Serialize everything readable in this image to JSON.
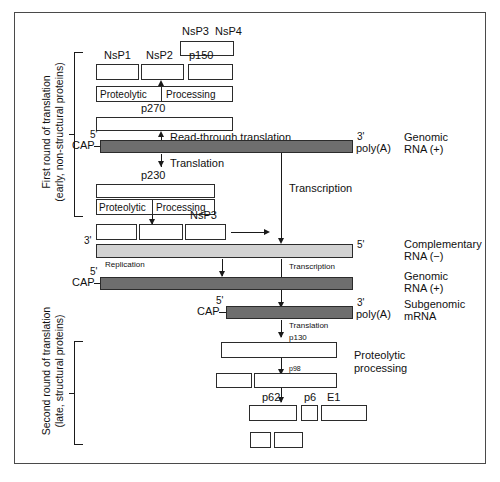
{
  "figure": {
    "title_hidden": "",
    "colors": {
      "strand_positive": "#6e6e6e",
      "strand_negative": "#d2d2d2",
      "protein_box": "#ffffff",
      "ink": "#1a1a1a",
      "frame": "#4a4a4a"
    }
  },
  "side_labels": {
    "first_round_line1": "First round of translation",
    "first_round_line2": "(early, non-structural proteins)",
    "second_round_line1": "Second round of translation",
    "second_round_line2": "(late, structural proteins)"
  },
  "top_cleavage": {
    "nsp3": "NsP3",
    "nsp4": "NsP4",
    "nsp1": "NsP1",
    "nsp2": "NsP2",
    "p150": "p150"
  },
  "processing_bars": {
    "proteolytic": "Proteolytic",
    "processing": "Processing"
  },
  "polyproteins": {
    "p270": "p270",
    "p230": "p230",
    "p130": "p130",
    "p98": "p98"
  },
  "lower_cleavage": {
    "nsp3": "NsP3"
  },
  "structural_proteins": {
    "p62": "p62",
    "p6": "p6",
    "e1": "E1"
  },
  "process_labels": {
    "read_through_translation": "Read-through translation",
    "translation": "Translation",
    "transcription_main": "Transcription",
    "transcription_lower": "Transcription",
    "replication": "Replication",
    "translation_lower": "Translation",
    "proteolytic_processing_line1": "Proteolytic",
    "proteolytic_processing_line2": "processing"
  },
  "termini": {
    "five_prime": "5'",
    "three_prime": "3'",
    "cap": "CAP",
    "poly_a": "poly(A)"
  },
  "rna_legend": {
    "genomic_plus_line1": "Genomic",
    "genomic_plus_line2": "RNA (+)",
    "complementary_minus_line1": "Complementary",
    "complementary_minus_line2": "RNA (−)",
    "genomic_plus2_line1": "Genomic",
    "genomic_plus2_line2": "RNA (+)",
    "subgenomic_line1": "Subgenomic",
    "subgenomic_line2": "mRNA"
  }
}
